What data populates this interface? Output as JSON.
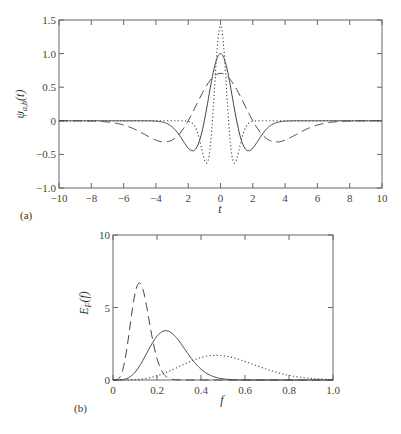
{
  "chart_data": [
    {
      "type": "line",
      "panel_label": "(a)",
      "title": "",
      "xlabel": "t",
      "ylabel": "ψ_{a,b}(t)",
      "xlim": [
        -10,
        10
      ],
      "ylim": [
        -1.0,
        1.5
      ],
      "xticks": [
        -10,
        -8,
        -6,
        -4,
        -2,
        0,
        2,
        4,
        6,
        8,
        10
      ],
      "xtick_labels": [
        "−10",
        "−8",
        "−6",
        "−4",
        "2",
        "0",
        "2",
        "4",
        "6",
        "8",
        "10"
      ],
      "yticks": [
        -1.0,
        -0.5,
        0,
        0.5,
        1.0,
        1.5
      ],
      "ytick_labels": [
        "−1.0",
        "−0.5",
        "0",
        "0.5",
        "1.0",
        "1.5"
      ],
      "grid": false,
      "legend": null,
      "series": [
        {
          "name": "a=0.5 (dotted)",
          "style": "dotted",
          "scale": 0.5,
          "amplitude": 1.414,
          "x": [
            -10,
            -3,
            -2,
            -1.5,
            -1.2,
            -0.87,
            -0.6,
            -0.4,
            -0.2,
            0,
            0.2,
            0.4,
            0.6,
            0.87,
            1.2,
            1.5,
            2,
            3,
            10
          ],
          "y": [
            0,
            0,
            -0.01,
            -0.12,
            -0.35,
            -0.63,
            -0.49,
            -0.06,
            0.75,
            1.41,
            0.75,
            -0.06,
            -0.49,
            -0.63,
            -0.35,
            -0.12,
            -0.01,
            0,
            0
          ]
        },
        {
          "name": "a=1 (solid)",
          "style": "solid",
          "scale": 1.0,
          "amplitude": 1.0,
          "x": [
            -10,
            -5,
            -4,
            -3,
            -2.5,
            -2,
            -1.73,
            -1.5,
            -1,
            -0.5,
            0,
            0.5,
            1,
            1.5,
            1.73,
            2,
            2.5,
            3,
            4,
            5,
            10
          ],
          "y": [
            0,
            0,
            -0.005,
            -0.09,
            -0.23,
            -0.41,
            -0.45,
            -0.42,
            0,
            0.66,
            1.0,
            0.66,
            0,
            -0.42,
            -0.45,
            -0.41,
            -0.23,
            -0.09,
            -0.005,
            0,
            0
          ]
        },
        {
          "name": "a=2 (dashed)",
          "style": "dashed",
          "scale": 2.0,
          "amplitude": 0.707,
          "x": [
            -10,
            -8,
            -7,
            -6,
            -5,
            -4,
            -3.46,
            -3,
            -2,
            -1,
            0,
            1,
            2,
            3,
            3.46,
            4,
            5,
            6,
            7,
            8,
            10
          ],
          "y": [
            0,
            -0.01,
            -0.04,
            -0.1,
            -0.22,
            -0.3,
            -0.32,
            -0.3,
            0,
            0.47,
            0.71,
            0.47,
            0,
            -0.3,
            -0.32,
            -0.3,
            -0.22,
            -0.1,
            -0.04,
            -0.01,
            0
          ]
        }
      ]
    },
    {
      "type": "line",
      "panel_label": "(b)",
      "title": "",
      "xlabel": "f",
      "ylabel": "E_F(f)",
      "xlim": [
        0,
        1.0
      ],
      "ylim": [
        0,
        10
      ],
      "xticks": [
        0,
        0.2,
        0.4,
        0.6,
        0.8,
        1.0
      ],
      "xtick_labels": [
        "0",
        "0.2",
        "0.4",
        "0.6",
        "0.8",
        "1.0"
      ],
      "yticks": [
        0,
        5,
        10
      ],
      "ytick_labels": [
        "0",
        "5",
        "10"
      ],
      "grid": false,
      "legend": null,
      "series": [
        {
          "name": "a=2 (dashed)",
          "style": "dashed",
          "peak_f": 0.12,
          "peak_value": 6.7
        },
        {
          "name": "a=1 (solid)",
          "style": "solid",
          "peak_f": 0.24,
          "peak_value": 3.4
        },
        {
          "name": "a=0.5 (dotted)",
          "style": "dotted",
          "peak_f": 0.47,
          "peak_value": 1.7
        }
      ]
    }
  ],
  "labels": {
    "panel_a": "(a)",
    "panel_b": "(b)",
    "xlabel_a": "t",
    "xlabel_b": "f",
    "ylabel_a_main": "ψ",
    "ylabel_a_sub": "a,b",
    "ylabel_a_arg": "(t)",
    "ylabel_b_main": "E",
    "ylabel_b_sub": "F",
    "ylabel_b_arg": "(f)"
  }
}
